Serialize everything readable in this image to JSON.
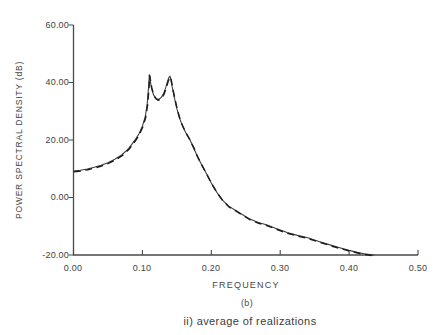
{
  "chart_data": {
    "type": "line",
    "title": "",
    "xlabel": "FREQUENCY",
    "ylabel": "POWER SPECTRAL DENSITY (dB)",
    "sub_label": "(b)",
    "caption": "ii) average of realizations",
    "xlim": [
      0.0,
      0.5
    ],
    "ylim": [
      -20.0,
      60.0
    ],
    "grid": false,
    "legend": "none",
    "x_tick_values": [
      0.0,
      0.1,
      0.2,
      0.3,
      0.4,
      0.5
    ],
    "x_tick_labels": [
      "0.00",
      "0.10",
      "0.20",
      "0.30",
      "0.40",
      "0.50"
    ],
    "y_tick_values": [
      60,
      40,
      20,
      0,
      -20
    ],
    "y_tick_labels": [
      "60.00",
      "40.00",
      "20.00",
      "0.00",
      "-20.00"
    ],
    "series": [
      {
        "name": "power spectral density",
        "line_style": "solid"
      },
      {
        "name": "average of realizations",
        "line_style": "dashed"
      }
    ],
    "x": [
      0.0,
      0.01,
      0.02,
      0.03,
      0.04,
      0.05,
      0.06,
      0.07,
      0.08,
      0.09,
      0.095,
      0.1,
      0.104,
      0.107,
      0.109,
      0.11,
      0.1115,
      0.113,
      0.116,
      0.119,
      0.122,
      0.125,
      0.128,
      0.131,
      0.134,
      0.137,
      0.139,
      0.14,
      0.1415,
      0.143,
      0.146,
      0.15,
      0.154,
      0.158,
      0.163,
      0.168,
      0.174,
      0.18,
      0.187,
      0.194,
      0.2,
      0.208,
      0.216,
      0.225,
      0.235,
      0.245,
      0.256,
      0.268,
      0.28,
      0.295,
      0.31,
      0.325,
      0.34,
      0.355,
      0.37,
      0.385,
      0.4,
      0.412,
      0.422,
      0.43,
      0.436
    ],
    "y": [
      9.2,
      9.5,
      9.9,
      10.5,
      11.2,
      12.1,
      13.3,
      14.8,
      17.0,
      20.2,
      22.2,
      24.8,
      28.0,
      32.5,
      38.5,
      42.7,
      40.5,
      38.3,
      35.8,
      34.6,
      34.1,
      34.3,
      35.0,
      36.3,
      38.3,
      40.8,
      42.0,
      42.2,
      40.8,
      38.8,
      35.2,
      31.0,
      27.5,
      25.0,
      22.5,
      20.5,
      17.5,
      14.2,
      11.0,
      7.8,
      5.0,
      1.8,
      -0.8,
      -3.0,
      -4.4,
      -5.9,
      -7.5,
      -8.7,
      -9.5,
      -10.9,
      -12.2,
      -13.2,
      -14.0,
      -15.2,
      -16.3,
      -17.4,
      -18.4,
      -19.1,
      -19.6,
      -19.85,
      -20.0
    ]
  }
}
